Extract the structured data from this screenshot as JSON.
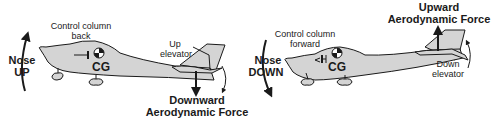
{
  "left_panel": {
    "control_label_line1": "Control column",
    "control_label_line2": "back",
    "pitch_line1": "Nose",
    "pitch_line2": "UP",
    "cg_label": "CG",
    "elevator_line1": "Up",
    "elevator_line2": "elevator",
    "force_line1": "Downward",
    "force_line2": "Aerodynamic Force"
  },
  "right_panel": {
    "control_label_line1": "Control column",
    "control_label_line2": "forward",
    "pitch_line1": "Nose",
    "pitch_line2": "DOWN",
    "cg_label": "CG",
    "elevator_line1": "Down",
    "elevator_line2": "elevator",
    "force_line1": "Upward",
    "force_line2": "Aerodynamic Force"
  },
  "colors": {
    "fuselage": "#d4d4d4",
    "ink": "#1a1a1a"
  }
}
